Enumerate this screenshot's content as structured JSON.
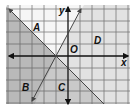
{
  "diagram": {
    "type": "coordinate-plane-inequality-regions",
    "axes": {
      "x_label": "x",
      "y_label": "y",
      "origin_label": "O"
    },
    "regions": [
      {
        "label": "A",
        "shade": "white"
      },
      {
        "label": "B",
        "shade": "dark"
      },
      {
        "label": "C",
        "shade": "dark"
      },
      {
        "label": "D",
        "shade": "light"
      }
    ],
    "lines": [
      {
        "name": "descending-line",
        "slope": "negative"
      },
      {
        "name": "ascending-line",
        "slope": "positive"
      }
    ],
    "colors": {
      "background": "#ffffff",
      "light_region": "#e2e2e2",
      "dark_region": "#b9b9b9",
      "white_region": "#f6f6f6",
      "grid": "#555555",
      "axis": "#111111",
      "line": "#444444"
    }
  }
}
